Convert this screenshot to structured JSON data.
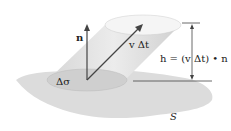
{
  "diagram": {
    "labels": {
      "normal_vector": "n",
      "velocity": "v Δt",
      "height_eq": "h = (v Δt) • n",
      "area": "Δσ",
      "surface": "S"
    },
    "colors": {
      "surface": "#d9d9d9",
      "cylinder": "#e6e6e6",
      "top_cap": "#f4f4f4",
      "base": "#cdcdcd",
      "lines": "#444444"
    }
  }
}
